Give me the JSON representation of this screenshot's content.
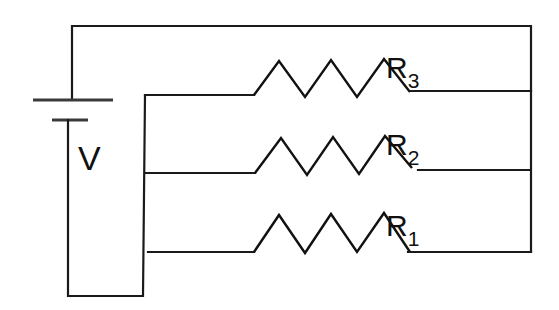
{
  "diagram": {
    "type": "parallel-resistor-circuit",
    "source": {
      "label": "V",
      "kind": "battery"
    },
    "resistors": [
      {
        "id": "R3",
        "label": "R",
        "subscript": "3",
        "position": "top"
      },
      {
        "id": "R2",
        "label": "R",
        "subscript": "2",
        "position": "middle"
      },
      {
        "id": "R1",
        "label": "R",
        "subscript": "1",
        "position": "bottom"
      }
    ],
    "connection": "parallel"
  },
  "colors": {
    "line": "#1a1a1a",
    "background": "#ffffff"
  }
}
